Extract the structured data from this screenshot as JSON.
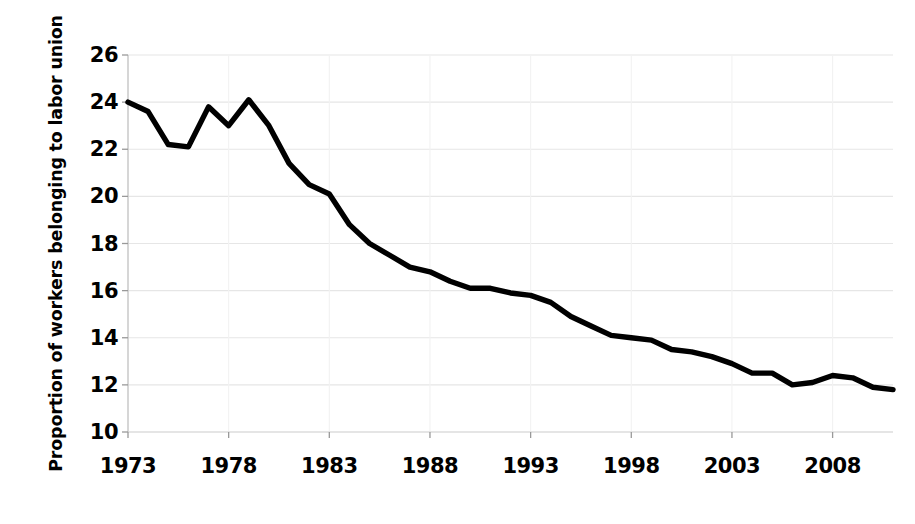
{
  "chart_data": {
    "type": "line",
    "title": "",
    "xlabel": "",
    "ylabel": "Proportion of workers belonging to labor union",
    "xlim": [
      1973,
      2011
    ],
    "ylim": [
      10,
      26
    ],
    "grid": true,
    "legend": "none",
    "line_color": "#000000",
    "grid_color": "#e6e6e6",
    "background_color": "#ffffff",
    "x_tick_labels": [
      "1973",
      "1978",
      "1983",
      "1988",
      "1993",
      "1998",
      "2003",
      "2008"
    ],
    "x_tick_values": [
      1973,
      1978,
      1983,
      1988,
      1993,
      1998,
      2003,
      2008
    ],
    "y_tick_labels": [
      "10",
      "12",
      "14",
      "16",
      "18",
      "20",
      "22",
      "24",
      "26"
    ],
    "y_tick_values": [
      10,
      12,
      14,
      16,
      18,
      20,
      22,
      24,
      26
    ],
    "x": [
      1973,
      1974,
      1975,
      1976,
      1977,
      1978,
      1979,
      1980,
      1981,
      1982,
      1983,
      1984,
      1985,
      1986,
      1987,
      1988,
      1989,
      1990,
      1991,
      1992,
      1993,
      1994,
      1995,
      1996,
      1997,
      1998,
      1999,
      2000,
      2001,
      2002,
      2003,
      2004,
      2005,
      2006,
      2007,
      2008,
      2009,
      2010,
      2011
    ],
    "values": [
      24.0,
      23.6,
      22.2,
      22.1,
      23.8,
      23.0,
      24.1,
      23.0,
      21.4,
      20.5,
      20.1,
      18.8,
      18.0,
      17.5,
      17.0,
      16.8,
      16.4,
      16.1,
      16.1,
      15.9,
      15.8,
      15.5,
      14.9,
      14.5,
      14.1,
      14.0,
      13.9,
      13.5,
      13.4,
      13.2,
      12.9,
      12.5,
      12.5,
      12.0,
      12.1,
      12.4,
      12.3,
      11.9,
      11.8
    ]
  }
}
